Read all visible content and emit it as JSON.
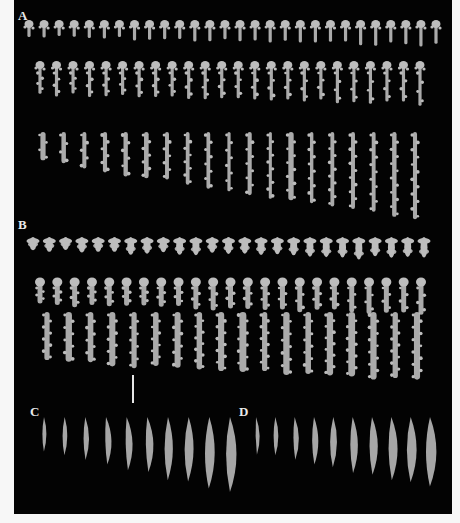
{
  "figure": {
    "background": "#030303",
    "sclerite_color": "#bdbdbd",
    "panels": [
      {
        "label": "A",
        "x": 4,
        "y": 8
      },
      {
        "label": "B",
        "x": 4,
        "y": 217
      },
      {
        "label": "C",
        "x": 16,
        "y": 404
      },
      {
        "label": "D",
        "x": 225,
        "y": 404
      }
    ],
    "scale_bar": {
      "x": 118,
      "y": 375,
      "height": 28
    },
    "rows": [
      {
        "panel": "A",
        "type": "club",
        "y": 27,
        "x0": 15,
        "x1": 422,
        "count": 28,
        "len0": 18,
        "len1": 26
      },
      {
        "panel": "A",
        "type": "club-long",
        "y": 68,
        "x0": 26,
        "x1": 406,
        "count": 24,
        "len0": 34,
        "len1": 44
      },
      {
        "panel": "A",
        "type": "spindle",
        "y": 140,
        "x0": 29,
        "x1": 401,
        "count": 19,
        "len0": 30,
        "len1": 88
      },
      {
        "panel": "B",
        "type": "radiate",
        "y": 243,
        "x0": 19,
        "x1": 410,
        "count": 25,
        "len0": 18,
        "len1": 26
      },
      {
        "panel": "B",
        "type": "club-warty",
        "y": 285,
        "x0": 26,
        "x1": 407,
        "count": 23,
        "len0": 30,
        "len1": 38
      },
      {
        "panel": "B",
        "type": "warty-rod",
        "y": 320,
        "x0": 33,
        "x1": 403,
        "count": 18,
        "len0": 50,
        "len1": 68
      },
      {
        "panel": "C",
        "type": "scale-spindle",
        "y": 425,
        "x0": 30,
        "x1": 216,
        "count": 10,
        "len0": 34,
        "len1": 75
      },
      {
        "panel": "D",
        "type": "scale-spindle",
        "y": 425,
        "x0": 242,
        "x1": 416,
        "count": 10,
        "len0": 36,
        "len1": 70
      }
    ]
  }
}
